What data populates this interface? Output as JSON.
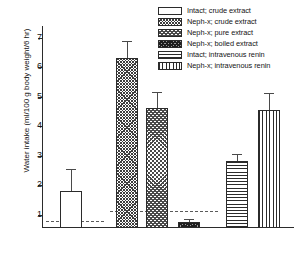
{
  "axis": {
    "ylabel": "Water intake (ml/100 g body weight/6 hr)",
    "ticks": [
      "7",
      "6",
      "5",
      "4",
      "3",
      "2",
      "1"
    ]
  },
  "legend": {
    "items": [
      {
        "label": "Intact; crude extract",
        "pattern": "open"
      },
      {
        "label": "Neph-x; crude extract",
        "pattern": "crossdot"
      },
      {
        "label": "Neph-x; pure extract",
        "pattern": "checker"
      },
      {
        "label": "Neph-x; boiled extract",
        "pattern": "dense"
      },
      {
        "label": "Intact; intravenous renin",
        "pattern": "horiz"
      },
      {
        "label": "Neph-x; intravenous renin",
        "pattern": "vert"
      }
    ]
  },
  "chart_data": {
    "type": "bar",
    "title": "",
    "xlabel": "",
    "ylabel": "Water intake (ml/100 g body weight/6 hr)",
    "ylim": [
      0.55,
      7.4
    ],
    "yticks": [
      1,
      2,
      3,
      4,
      5,
      6,
      7
    ],
    "grid": false,
    "legend_position": "top-right",
    "categories": [
      "Intact; crude extract",
      "Neph-x; crude extract",
      "Neph-x; pure extract",
      "Neph-x; boiled extract",
      "Intact; intravenous renin",
      "Neph-x; intravenous renin"
    ],
    "values": [
      1.82,
      6.32,
      4.62,
      0.75,
      2.82,
      4.56
    ],
    "errors": [
      0.72,
      0.58,
      0.55,
      0.1,
      0.25,
      0.58
    ],
    "patterns": [
      "open",
      "crossdot",
      "checker",
      "dense",
      "horiz",
      "vert"
    ],
    "reference_lines": [
      {
        "value": 0.8,
        "span": "intact-group",
        "style": "dashed"
      },
      {
        "value": 1.12,
        "span": "nephx-group",
        "style": "dashed"
      }
    ],
    "annotations": []
  }
}
